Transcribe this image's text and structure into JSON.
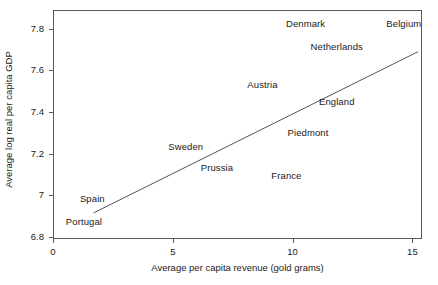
{
  "chart_data": {
    "type": "scatter",
    "title": "",
    "xlabel": "Average per capita revenue (gold grams)",
    "ylabel": "Average log real per capita GDP",
    "xlim": [
      0,
      15.4
    ],
    "ylim": [
      6.79,
      7.89
    ],
    "xticks": [
      0,
      5,
      10,
      15
    ],
    "xtick_labels": [
      "0",
      "5",
      "10",
      "15"
    ],
    "yticks": [
      6.8,
      7.0,
      7.2,
      7.4,
      7.6,
      7.8
    ],
    "ytick_labels": [
      "6.8",
      "7",
      "7.2",
      "7.4",
      "7.6",
      "7.8"
    ],
    "grid": false,
    "legend": "none",
    "marker_style": "text-label",
    "points": [
      {
        "label": "Denmark",
        "x": 10.5,
        "y": 7.83
      },
      {
        "label": "Belgium",
        "x": 14.6,
        "y": 7.83
      },
      {
        "label": "Netherlands",
        "x": 11.8,
        "y": 7.72
      },
      {
        "label": "Austria",
        "x": 8.7,
        "y": 7.54
      },
      {
        "label": "England",
        "x": 11.8,
        "y": 7.46
      },
      {
        "label": "Piedmont",
        "x": 10.6,
        "y": 7.31
      },
      {
        "label": "Sweden",
        "x": 5.5,
        "y": 7.24
      },
      {
        "label": "Prussia",
        "x": 6.8,
        "y": 7.14
      },
      {
        "label": "France",
        "x": 9.7,
        "y": 7.1
      },
      {
        "label": "Spain",
        "x": 1.6,
        "y": 6.99
      },
      {
        "label": "Portugal",
        "x": 1.25,
        "y": 6.88
      }
    ],
    "fit_line": {
      "name": "linear fit",
      "x0": 1.65,
      "y0": 6.92,
      "x1": 15.2,
      "y1": 7.695,
      "color": "#555555"
    },
    "colors": {
      "frame": "#5a5a5a",
      "text": "#1a1a1a",
      "line": "#555555",
      "background": "#ffffff"
    }
  }
}
